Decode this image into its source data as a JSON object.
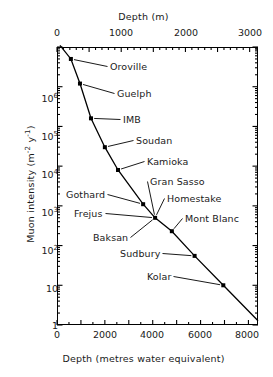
{
  "figure": {
    "kind": "scientific-figure",
    "background": "#ffffff",
    "ink_color": "#000000"
  },
  "chart_data": {
    "type": "line",
    "title": "",
    "subtitle": "",
    "xlabel": "Depth (metres water equivalent)",
    "ylabel": "Muon intensity (m⁻² y⁻¹)",
    "x2label": "Depth (m)",
    "xscale": "linear",
    "yscale": "log",
    "xlim": [
      0,
      8400
    ],
    "ylim": [
      1,
      10000000
    ],
    "x2lim": [
      0,
      3130
    ],
    "grid": false,
    "legend": null,
    "series": [
      {
        "name": "Muon intensity vs depth",
        "marker": "filled-square",
        "line": "solid",
        "x": [
          580,
          960,
          1420,
          2000,
          2550,
          3600,
          4100,
          4800,
          5750,
          6950
        ],
        "y": [
          5000000,
          1200000,
          160000,
          30000,
          8000,
          1100,
          500,
          230,
          55,
          10
        ],
        "point_labels": [
          "Oroville",
          "Guelph",
          "IMB",
          "Soudan",
          "Kamioka",
          "Gothard",
          "Frejus",
          "Mont Blanc",
          "Sudbury",
          "Kolar"
        ]
      }
    ],
    "annotations": [
      {
        "text": "Gran Sasso",
        "points_to_x": 4100,
        "points_to_y": 500
      },
      {
        "text": "Homestake",
        "points_to_x": 4100,
        "points_to_y": 500
      },
      {
        "text": "Baksan",
        "points_to_x": 4100,
        "points_to_y": 500
      }
    ],
    "xticks": [
      0,
      2000,
      4000,
      6000,
      8000
    ],
    "xticklabels": [
      "0",
      "2000",
      "4000",
      "6000",
      "8000"
    ],
    "x2ticks": [
      0,
      1000,
      2000,
      3000
    ],
    "x2ticklabels": [
      "0",
      "1000",
      "2000",
      "3000"
    ],
    "yticks": [
      1,
      10,
      100,
      1000,
      10000,
      100000,
      1000000
    ],
    "yticklabels": [
      "1",
      "10",
      "10²",
      "10³",
      "10⁴",
      "10⁵",
      "10⁶"
    ]
  },
  "axes": {
    "top": {
      "title": "Depth (m)",
      "ticks": [
        {
          "label": "0",
          "x": 57
        },
        {
          "label": "1000",
          "x": 121
        },
        {
          "label": "2000",
          "x": 186
        },
        {
          "label": "3000",
          "x": 250
        }
      ]
    },
    "bottom": {
      "title": "Depth (metres water equivalent)",
      "ticks": [
        {
          "label": "0",
          "x": 57
        },
        {
          "label": "2000",
          "x": 105
        },
        {
          "label": "4000",
          "x": 152
        },
        {
          "label": "6000",
          "x": 200
        },
        {
          "label": "8000",
          "x": 247
        }
      ]
    },
    "left": {
      "title_main": "Muon intensity (m",
      "title_sup1": "-2",
      "title_mid": " y",
      "title_sup2": "-1",
      "title_end": ")",
      "ticks": [
        {
          "base": "10",
          "exp": "6",
          "y": 98
        },
        {
          "base": "10",
          "exp": "5",
          "y": 136
        },
        {
          "base": "10",
          "exp": "4",
          "y": 174
        },
        {
          "base": "10",
          "exp": "3",
          "y": 212
        },
        {
          "base": "10",
          "exp": "2",
          "y": 250
        },
        {
          "base": "10",
          "exp": "",
          "y": 288
        },
        {
          "base": "1",
          "exp": "",
          "y": 325
        }
      ]
    }
  },
  "point_labels": [
    {
      "name": "Oroville",
      "x": 110,
      "y": 61
    },
    {
      "name": "Guelph",
      "x": 117,
      "y": 88
    },
    {
      "name": "IMB",
      "x": 123,
      "y": 114
    },
    {
      "name": "Soudan",
      "x": 136,
      "y": 135
    },
    {
      "name": "Kamioka",
      "x": 147,
      "y": 156
    },
    {
      "name": "Gran Sasso",
      "x": 150,
      "y": 176
    },
    {
      "name": "Gothard",
      "x": 66,
      "y": 189
    },
    {
      "name": "Homestake",
      "x": 167,
      "y": 193
    },
    {
      "name": "Frejus",
      "x": 74,
      "y": 208
    },
    {
      "name": "Mont Blanc",
      "x": 185,
      "y": 213
    },
    {
      "name": "Baksan",
      "x": 93,
      "y": 232
    },
    {
      "name": "Sudbury",
      "x": 120,
      "y": 248
    },
    {
      "name": "Kolar",
      "x": 147,
      "y": 271
    }
  ]
}
